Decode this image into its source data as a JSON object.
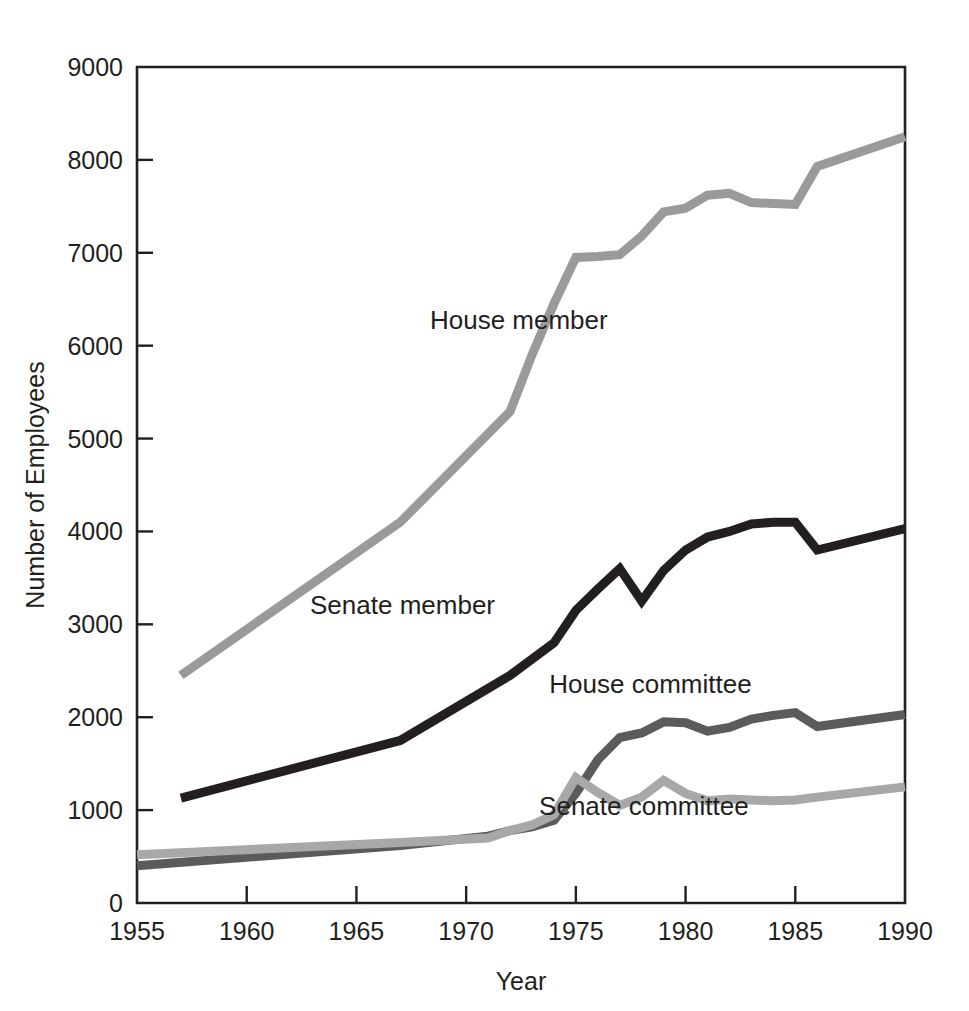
{
  "chart_data": {
    "type": "line",
    "title": "",
    "xlabel": "Year",
    "ylabel": "Number of Employees",
    "xlim": [
      1955,
      1990
    ],
    "ylim": [
      0,
      9000
    ],
    "grid": false,
    "legend_position": "inline-annotations",
    "x_ticks": [
      1955,
      1960,
      1965,
      1970,
      1975,
      1980,
      1985,
      1990
    ],
    "y_ticks": [
      0,
      1000,
      2000,
      3000,
      4000,
      5000,
      6000,
      7000,
      8000,
      9000
    ],
    "series": [
      {
        "name": "House member",
        "color": "#9a9a9a",
        "label_x": 1972.4,
        "label_y": 6180,
        "x": [
          1957,
          1967,
          1972,
          1973,
          1974,
          1975,
          1976,
          1977,
          1978,
          1979,
          1980,
          1981,
          1982,
          1983,
          1984,
          1985,
          1986,
          1990
        ],
        "values": [
          2450,
          4100,
          5290,
          5900,
          6450,
          6950,
          6960,
          6980,
          7180,
          7440,
          7480,
          7620,
          7640,
          7540,
          7530,
          7520,
          7930,
          8250
        ]
      },
      {
        "name": "Senate member",
        "color": "#231f20",
        "label_x": 1967.1,
        "label_y": 3110,
        "x": [
          1957,
          1967,
          1972,
          1974,
          1975,
          1976,
          1977,
          1978,
          1979,
          1980,
          1981,
          1982,
          1983,
          1984,
          1985,
          1986,
          1990
        ],
        "values": [
          1130,
          1750,
          2450,
          2800,
          3150,
          3380,
          3600,
          3250,
          3580,
          3800,
          3940,
          4000,
          4080,
          4100,
          4100,
          3800,
          4030
        ]
      },
      {
        "name": "House committee",
        "color": "#5b5b5b",
        "label_x": 1978.4,
        "label_y": 2260,
        "x": [
          1955,
          1967,
          1971,
          1972,
          1973,
          1974,
          1975,
          1976,
          1977,
          1978,
          1979,
          1980,
          1981,
          1982,
          1983,
          1984,
          1985,
          1986,
          1990
        ],
        "values": [
          400,
          620,
          720,
          780,
          820,
          890,
          1180,
          1540,
          1780,
          1830,
          1950,
          1940,
          1850,
          1890,
          1980,
          2020,
          2050,
          1900,
          2030
        ]
      },
      {
        "name": "Senate committee",
        "color": "#a8a8a8",
        "label_x": 1978.1,
        "label_y": 950,
        "x": [
          1955,
          1967,
          1971,
          1972,
          1973,
          1974,
          1975,
          1976,
          1977,
          1978,
          1979,
          1980,
          1981,
          1982,
          1983,
          1984,
          1985,
          1986,
          1990
        ],
        "values": [
          520,
          650,
          700,
          780,
          840,
          950,
          1350,
          1190,
          1050,
          1140,
          1320,
          1180,
          1100,
          1120,
          1110,
          1100,
          1110,
          1140,
          1250
        ]
      }
    ]
  },
  "axes": {
    "y_title": "Number of Employees",
    "x_title": "Year",
    "y_tick_labels": [
      "0",
      "1000",
      "2000",
      "3000",
      "4000",
      "5000",
      "6000",
      "7000",
      "8000",
      "9000"
    ],
    "x_tick_labels": [
      "1955",
      "1960",
      "1965",
      "1970",
      "1975",
      "1980",
      "1985",
      "1990"
    ]
  },
  "annotations": [
    {
      "text": "House member"
    },
    {
      "text": "Senate member"
    },
    {
      "text": "House committee"
    },
    {
      "text": "Senate committee"
    }
  ]
}
